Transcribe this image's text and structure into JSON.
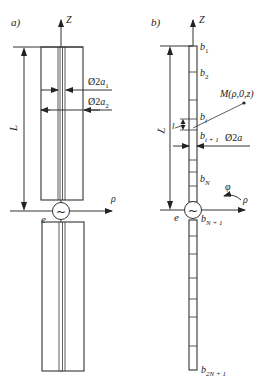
{
  "figure": {
    "panels": [
      {
        "id": "a",
        "label": "a)",
        "axis_z": "Z",
        "axis_rho": "ρ",
        "source_label": "e",
        "length_label": "L",
        "dimensions": [
          {
            "prefix": "Ø2",
            "var": "a",
            "sub": "1"
          },
          {
            "prefix": "Ø2",
            "var": "a",
            "sub": "2"
          }
        ]
      },
      {
        "id": "b",
        "label": "b)",
        "axis_z": "Z",
        "axis_rho": "ρ",
        "axis_phi": "φ",
        "source_label": "e",
        "length_label": "L",
        "segment_length_label": "l",
        "point_label": "M(ρ,0,z)",
        "diameter": {
          "prefix": "Ø2",
          "var": "a"
        },
        "segments": [
          {
            "var": "b",
            "sub": "1"
          },
          {
            "var": "b",
            "sub": "2"
          },
          {
            "var": "b",
            "sub": "i"
          },
          {
            "var": "b",
            "sub": "i + 1"
          },
          {
            "var": "b",
            "sub": "N"
          },
          {
            "var": "b",
            "sub": "N + 1"
          },
          {
            "var": "b",
            "sub": "2N + 1"
          }
        ]
      }
    ],
    "source_symbol": "~"
  }
}
